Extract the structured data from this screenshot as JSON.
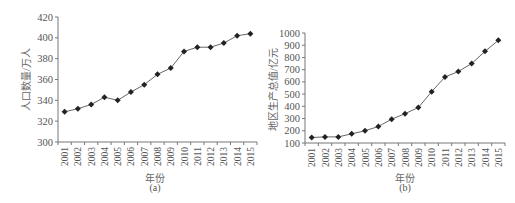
{
  "chart_data": [
    {
      "type": "line",
      "title": "",
      "caption": "(a)",
      "xlabel": "年份",
      "ylabel": "人口数量/万人",
      "categories": [
        "2001",
        "2002",
        "2003",
        "2004",
        "2005",
        "2006",
        "2007",
        "2008",
        "2009",
        "2010",
        "2011",
        "2012",
        "2013",
        "2014",
        "2015"
      ],
      "series": [
        {
          "name": "人口数量",
          "values": [
            329,
            332,
            336,
            343,
            340,
            348,
            355,
            365,
            371,
            387,
            391,
            391,
            395,
            402,
            404
          ]
        }
      ],
      "ylim": [
        300,
        420
      ],
      "yticks": [
        300,
        320,
        340,
        360,
        380,
        400,
        420
      ],
      "grid": false,
      "legend": "none",
      "marker": "diamond"
    },
    {
      "type": "line",
      "title": "",
      "caption": "(b)",
      "xlabel": "年份",
      "ylabel": "地区生产总值/亿元",
      "categories": [
        "2001",
        "2002",
        "2003",
        "2004",
        "2005",
        "2006",
        "2007",
        "2008",
        "2009",
        "2010",
        "2011",
        "2012",
        "2013",
        "2014",
        "2015"
      ],
      "series": [
        {
          "name": "地区生产总值",
          "values": [
            145,
            150,
            150,
            175,
            200,
            235,
            295,
            340,
            390,
            520,
            640,
            685,
            750,
            850,
            940
          ]
        }
      ],
      "ylim": [
        100,
        1000
      ],
      "yticks": [
        100,
        200,
        300,
        400,
        500,
        600,
        700,
        800,
        900,
        1000
      ],
      "grid": false,
      "legend": "none",
      "marker": "diamond"
    }
  ]
}
